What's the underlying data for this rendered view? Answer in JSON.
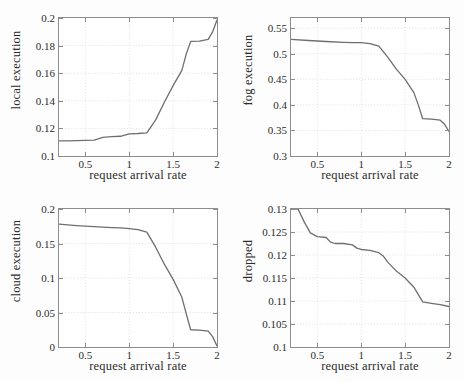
{
  "figure": {
    "background_color": "#fdfdfd",
    "line_color": "#6e6e6e",
    "grid_color": "#c8c8c8",
    "axis_color": "#8d8d8d",
    "panel_count": 4
  },
  "chart_data": [
    {
      "type": "line",
      "title": "",
      "xlabel": "request arrival rate",
      "ylabel": "local execution",
      "xlim": [
        0.2,
        2.0
      ],
      "ylim": [
        0.1,
        0.2
      ],
      "xticks": [
        0.5,
        1,
        1.5,
        2
      ],
      "xticklabels": [
        "0.5",
        "1",
        "1.5",
        "2"
      ],
      "yticks": [
        0.1,
        0.12,
        0.14,
        0.16,
        0.18,
        0.2
      ],
      "yticklabels": [
        "0.1",
        "0.12",
        "0.14",
        "0.16",
        "0.18",
        "0.2"
      ],
      "grid": true,
      "legend": null,
      "series": [
        {
          "name": "local execution",
          "x": [
            0.2,
            0.3,
            0.4,
            0.5,
            0.6,
            0.7,
            0.8,
            0.9,
            1.0,
            1.1,
            1.2,
            1.3,
            1.4,
            1.5,
            1.6,
            1.65,
            1.7,
            1.8,
            1.9,
            1.95,
            2.0
          ],
          "y": [
            0.111,
            0.111,
            0.1112,
            0.1113,
            0.1115,
            0.1135,
            0.114,
            0.1143,
            0.116,
            0.1163,
            0.1168,
            0.126,
            0.139,
            0.151,
            0.162,
            0.174,
            0.183,
            0.1832,
            0.1845,
            0.19,
            0.1985
          ]
        }
      ]
    },
    {
      "type": "line",
      "title": "",
      "xlabel": "request arrival rate",
      "ylabel": "fog execution",
      "xlim": [
        0.2,
        2.0
      ],
      "ylim": [
        0.3,
        0.57
      ],
      "xticks": [
        0.5,
        1,
        1.5,
        2
      ],
      "xticklabels": [
        "0.5",
        "1",
        "1.5",
        "2"
      ],
      "yticks": [
        0.3,
        0.35,
        0.4,
        0.45,
        0.5,
        0.55
      ],
      "yticklabels": [
        "0.3",
        "0.35",
        "0.4",
        "0.45",
        "0.5",
        "0.55"
      ],
      "grid": true,
      "legend": null,
      "series": [
        {
          "name": "fog execution",
          "x": [
            0.2,
            0.4,
            0.6,
            0.8,
            0.9,
            1.0,
            1.1,
            1.2,
            1.3,
            1.4,
            1.5,
            1.6,
            1.65,
            1.7,
            1.8,
            1.9,
            1.95,
            2.0
          ],
          "y": [
            0.528,
            0.526,
            0.524,
            0.5225,
            0.522,
            0.522,
            0.52,
            0.515,
            0.494,
            0.47,
            0.45,
            0.424,
            0.4,
            0.373,
            0.372,
            0.37,
            0.362,
            0.348
          ]
        }
      ]
    },
    {
      "type": "line",
      "title": "",
      "xlabel": "request arrival rate",
      "ylabel": "cloud execution",
      "xlim": [
        0.2,
        2.0
      ],
      "ylim": [
        0.0,
        0.2
      ],
      "xticks": [
        0.5,
        1,
        1.5,
        2
      ],
      "xticklabels": [
        "0.5",
        "1",
        "1.5",
        "2"
      ],
      "yticks": [
        0,
        0.05,
        0.1,
        0.15,
        0.2
      ],
      "yticklabels": [
        "0",
        "0.05",
        "0.1",
        "0.15",
        "0.2"
      ],
      "grid": true,
      "legend": null,
      "series": [
        {
          "name": "cloud execution",
          "x": [
            0.2,
            0.4,
            0.6,
            0.8,
            0.9,
            1.0,
            1.1,
            1.2,
            1.3,
            1.4,
            1.5,
            1.6,
            1.65,
            1.7,
            1.8,
            1.9,
            1.95,
            2.0
          ],
          "y": [
            0.178,
            0.176,
            0.1745,
            0.173,
            0.1725,
            0.1715,
            0.17,
            0.1665,
            0.145,
            0.12,
            0.098,
            0.072,
            0.048,
            0.025,
            0.0245,
            0.023,
            0.015,
            0.0015
          ]
        }
      ]
    },
    {
      "type": "line",
      "title": "",
      "xlabel": "request arrival rate",
      "ylabel": "dropped",
      "xlim": [
        0.2,
        2.0
      ],
      "ylim": [
        0.1,
        0.13
      ],
      "xticks": [
        0.5,
        1,
        1.5,
        2
      ],
      "xticklabels": [
        "0.5",
        "1",
        "1.5",
        "2"
      ],
      "yticks": [
        0.1,
        0.105,
        0.11,
        0.115,
        0.12,
        0.125,
        0.13
      ],
      "yticklabels": [
        "0.1",
        "0.105",
        "0.11",
        "0.115",
        "0.12",
        "0.125",
        "0.13"
      ],
      "grid": true,
      "legend": null,
      "series": [
        {
          "name": "dropped",
          "x": [
            0.2,
            0.28,
            0.35,
            0.42,
            0.5,
            0.6,
            0.65,
            0.7,
            0.8,
            0.9,
            0.95,
            1.0,
            1.1,
            1.2,
            1.25,
            1.3,
            1.4,
            1.5,
            1.6,
            1.7,
            1.8,
            1.9,
            2.0
          ],
          "y": [
            0.13,
            0.13,
            0.1272,
            0.1248,
            0.124,
            0.1238,
            0.1228,
            0.1225,
            0.1225,
            0.1222,
            0.1215,
            0.1212,
            0.121,
            0.1205,
            0.1198,
            0.1185,
            0.1165,
            0.115,
            0.113,
            0.1098,
            0.1095,
            0.1092,
            0.1088
          ]
        }
      ]
    }
  ]
}
